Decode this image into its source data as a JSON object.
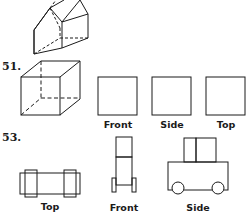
{
  "problems": [
    {
      "number": "51.",
      "figure": "cube-isometric",
      "views": [
        {
          "label": "Front"
        },
        {
          "label": "Side"
        },
        {
          "label": "Top"
        }
      ]
    },
    {
      "number": "53.",
      "figure": "vehicle-orthographic",
      "views": [
        {
          "label": "Top"
        },
        {
          "label": "Front"
        },
        {
          "label": "Side"
        }
      ]
    }
  ],
  "top_figure": "house-prism-isometric",
  "colors": {
    "line": "#1a1a1a",
    "background": "#ffffff"
  }
}
